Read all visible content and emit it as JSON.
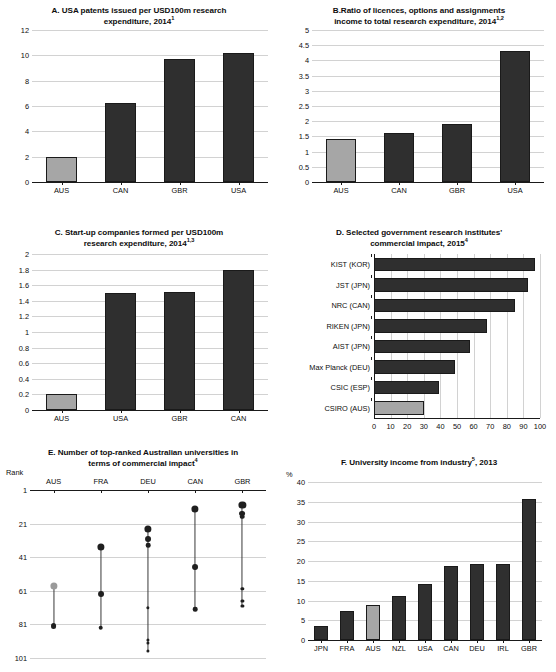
{
  "figure": {
    "title": "",
    "colors": {
      "highlight": "#a6a6a6",
      "bar": "#2f2f2f",
      "grid": "#d2d2d2",
      "axis": "#1a1a1a"
    }
  },
  "panels": {
    "A": {
      "label": "A.",
      "title_line1": "A. USA patents issued per USD100m research",
      "title_line2": "expenditure, 2014",
      "title_sup": "1",
      "yticks": [
        "0",
        "2",
        "4",
        "6",
        "8",
        "10",
        "12"
      ],
      "xticks": [
        "AUS",
        "CAN",
        "GBR",
        "USA"
      ]
    },
    "B": {
      "label": "B.",
      "title_line1": "B.Ratio of licences, options and assignments",
      "title_line2": "income to total research expenditure, 2014",
      "title_sup": "1,2",
      "yticks": [
        "0",
        "0.5",
        "1",
        "1.5",
        "2",
        "2.5",
        "3",
        "3.5",
        "4",
        "4.5",
        "5"
      ],
      "xticks": [
        "AUS",
        "CAN",
        "GBR",
        "USA"
      ]
    },
    "C": {
      "label": "C.",
      "title_line1": "C. Start-up companies formed per USD100m",
      "title_line2": "research expenditure, 2014",
      "title_sup": "1,3",
      "yticks": [
        "0",
        "0.2",
        "0.4",
        "0.6",
        "0.8",
        "1",
        "1.2",
        "1.4",
        "1.6",
        "1.8",
        "2"
      ],
      "xticks": [
        "AUS",
        "USA",
        "GBR",
        "CAN"
      ]
    },
    "D": {
      "label": "D.",
      "title_line1": "D. Selected government research institutes'",
      "title_line2": "commercial impact, 2015",
      "title_sup": "4",
      "xticks": [
        "0",
        "10",
        "20",
        "30",
        "40",
        "50",
        "60",
        "70",
        "80",
        "90",
        "100"
      ]
    },
    "E": {
      "label": "E.",
      "title_line1": "E. Number of top-ranked Australian universities in",
      "title_line2": "terms of commercial impact",
      "title_sup": "4",
      "axis_label": "Rank",
      "yticks": [
        "1",
        "21",
        "41",
        "61",
        "81",
        "101"
      ],
      "columns": [
        "AUS",
        "FRA",
        "DEU",
        "CAN",
        "GBR"
      ]
    },
    "F": {
      "label": "F.",
      "title_line1": "F. University income from industry",
      "title_sup": "5",
      "title_line1_tail": ", 2013",
      "axis_label": "%",
      "yticks": [
        "0",
        "5",
        "10",
        "15",
        "20",
        "25",
        "30",
        "35",
        "40"
      ],
      "xticks": [
        "JPN",
        "FRA",
        "AUS",
        "NZL",
        "USA",
        "CAN",
        "DEU",
        "IRL",
        "GBR"
      ]
    }
  },
  "chart_data": [
    {
      "panel": "A",
      "type": "bar",
      "title": "A. USA patents issued per USD100m research expenditure, 2014(1)",
      "categories": [
        "AUS",
        "CAN",
        "GBR",
        "USA"
      ],
      "values": [
        1.95,
        6.25,
        9.75,
        10.2
      ],
      "highlight_index": 0,
      "xlabel": "",
      "ylabel": "",
      "ylim": [
        0,
        12
      ],
      "ytick_step": 2,
      "grid": true,
      "legend": "none"
    },
    {
      "panel": "B",
      "type": "bar",
      "title": "B.Ratio of licences, options and assignments income to total research expenditure, 2014(1,2)",
      "categories": [
        "AUS",
        "CAN",
        "GBR",
        "USA"
      ],
      "values": [
        1.4,
        1.6,
        1.92,
        4.3
      ],
      "highlight_index": 0,
      "xlabel": "",
      "ylabel": "",
      "ylim": [
        0,
        5
      ],
      "ytick_step": 0.5,
      "grid": true,
      "legend": "none"
    },
    {
      "panel": "C",
      "type": "bar",
      "title": "C. Start-up companies formed per USD100m research expenditure, 2014(1,3)",
      "categories": [
        "AUS",
        "USA",
        "GBR",
        "CAN"
      ],
      "values": [
        0.2,
        1.5,
        1.51,
        1.8
      ],
      "highlight_index": 0,
      "xlabel": "",
      "ylabel": "",
      "ylim": [
        0,
        2
      ],
      "ytick_step": 0.2,
      "grid": true,
      "legend": "none"
    },
    {
      "panel": "D",
      "type": "bar",
      "orientation": "horizontal",
      "title": "D. Selected government research institutes' commercial impact, 2015(4)",
      "categories": [
        "KIST (KOR)",
        "JST (JPN)",
        "NRC (CAN)",
        "RIKEN (JPN)",
        "AIST (JPN)",
        "Max Planck (DEU)",
        "CSIC (ESP)",
        "CSIRO (AUS)"
      ],
      "values": [
        97,
        93,
        85,
        68,
        58,
        49,
        39,
        30
      ],
      "highlight_index": 7,
      "xlabel": "",
      "ylabel": "",
      "xlim": [
        0,
        100
      ],
      "xtick_step": 10,
      "grid": true,
      "legend": "none"
    },
    {
      "panel": "E",
      "type": "scatter",
      "subtype": "range-dot",
      "title": "E. Number of top-ranked Australian universities in terms of commercial impact(4)",
      "categories": [
        "AUS",
        "FRA",
        "DEU",
        "CAN",
        "GBR"
      ],
      "ylabel": "Rank",
      "ylim": [
        1,
        101
      ],
      "y_inverted": true,
      "ytick_step": 20,
      "grid": true,
      "legend": "none",
      "series": [
        {
          "name": "AUS",
          "top": 58,
          "bottom": 82,
          "points": [
            58,
            82
          ],
          "highlight": true
        },
        {
          "name": "FRA",
          "top": 35,
          "bottom": 83,
          "points": [
            35,
            63,
            83
          ],
          "highlight": false
        },
        {
          "name": "DEU",
          "top": 24,
          "bottom": 97,
          "points": [
            24,
            30,
            34,
            71,
            90,
            92,
            97
          ],
          "highlight": false
        },
        {
          "name": "CAN",
          "top": 12,
          "bottom": 72,
          "points": [
            12,
            47,
            72
          ],
          "highlight": false
        },
        {
          "name": "GBR",
          "top": 10,
          "bottom": 70,
          "points": [
            10,
            15,
            17,
            60,
            67,
            70
          ],
          "highlight": false
        }
      ]
    },
    {
      "panel": "F",
      "type": "bar",
      "title": "F. University income from industry(5), 2013",
      "categories": [
        "JPN",
        "FRA",
        "AUS",
        "NZL",
        "USA",
        "CAN",
        "DEU",
        "IRL",
        "GBR"
      ],
      "values": [
        3.6,
        7.3,
        8.8,
        11.2,
        14.1,
        18.7,
        19.2,
        19.2,
        35.6
      ],
      "highlight_index": 2,
      "xlabel": "",
      "ylabel": "%",
      "ylim": [
        0,
        40
      ],
      "ytick_step": 5,
      "grid": true,
      "legend": "none"
    }
  ]
}
